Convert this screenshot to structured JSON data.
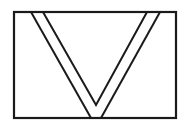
{
  "figure": {
    "stroke_color": "#1a1a1a",
    "background_color": "#ffffff",
    "frame": {
      "x": 14,
      "y": 12,
      "width": 162,
      "height": 106
    },
    "outer_v": {
      "left_top": [
        31,
        12
      ],
      "left_bottom": [
        91,
        118
      ],
      "right_bottom": [
        101,
        118
      ],
      "right_top": [
        160,
        12
      ]
    },
    "inner_v": {
      "left_top": [
        43,
        12
      ],
      "apex": [
        96,
        105
      ],
      "right_top": [
        147,
        12
      ]
    }
  }
}
